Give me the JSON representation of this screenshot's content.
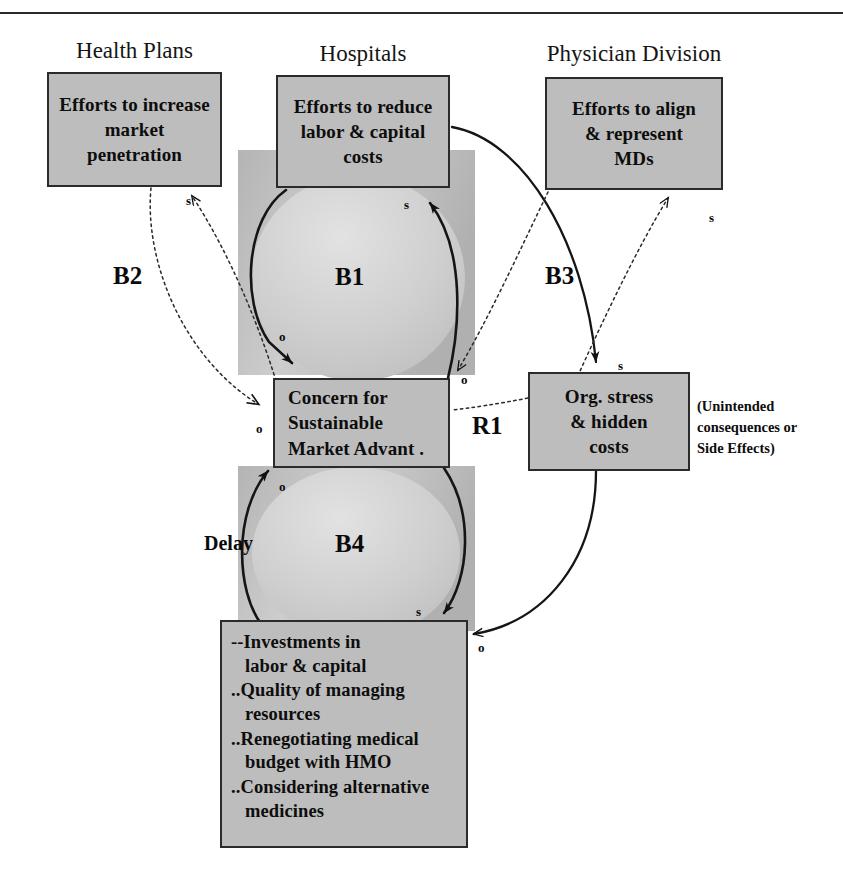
{
  "page": {
    "clipped_header_text": "",
    "background": "#ffffff",
    "box_fill": "#bdbdbd",
    "box_stroke": "#2b2b2b",
    "band_fill": "#bdbdbd",
    "line_color": "#1a1a1a"
  },
  "captions": [
    {
      "id": "health-plans",
      "label": "Health Plans"
    },
    {
      "id": "hospitals",
      "label": "Hospitals"
    },
    {
      "id": "physician-division",
      "label": "Physician Division"
    }
  ],
  "nodes": {
    "health_plans": {
      "lines": [
        "Efforts to increase",
        "market",
        "penetration"
      ]
    },
    "hospitals": {
      "lines": [
        "Efforts to reduce",
        "labor & capital",
        "costs"
      ]
    },
    "physician": {
      "lines": [
        "Efforts to align",
        "& represent",
        "MDs"
      ]
    },
    "concern": {
      "lines": [
        "Concern for",
        "Sustainable",
        "Market  Advant ."
      ]
    },
    "org_stress": {
      "lines": [
        "Org. stress",
        "& hidden",
        "costs"
      ]
    },
    "investments": {
      "items": [
        {
          "bullet": "--",
          "l1": "Investments in",
          "l2": "labor & capital"
        },
        {
          "bullet": "..",
          "l1": "Quality of managing",
          "l2": "resources"
        },
        {
          "bullet": "..",
          "l1": "Renegotiating medical",
          "l2": "budget with HMO"
        },
        {
          "bullet": "..",
          "l1": "Considering alternative",
          "l2": "medicines"
        }
      ]
    }
  },
  "loops": [
    {
      "id": "B2",
      "label": "B2"
    },
    {
      "id": "B1",
      "label": "B1"
    },
    {
      "id": "B3",
      "label": "B3"
    },
    {
      "id": "R1",
      "label": "R1"
    },
    {
      "id": "B4",
      "label": "B4"
    }
  ],
  "delay": {
    "label": "Delay"
  },
  "side_note": {
    "lines": [
      "(Unintended",
      "consequences or",
      "Side Effects)"
    ]
  },
  "polarities": [
    {
      "id": "p-hp-s",
      "mark": "s",
      "x": 186,
      "y": 193
    },
    {
      "id": "p-hosp-s",
      "mark": "s",
      "x": 404,
      "y": 197
    },
    {
      "id": "p-phys-s",
      "mark": "s",
      "x": 709,
      "y": 210
    },
    {
      "id": "p-b1-o",
      "mark": "o",
      "x": 279,
      "y": 329
    },
    {
      "id": "p-b3-o",
      "mark": "o",
      "x": 461,
      "y": 372
    },
    {
      "id": "p-b3-s",
      "mark": "s",
      "x": 618,
      "y": 358
    },
    {
      "id": "p-concern-o",
      "mark": "o",
      "x": 256,
      "y": 421
    },
    {
      "id": "p-b4-o",
      "mark": "o",
      "x": 279,
      "y": 479
    },
    {
      "id": "p-b4-s",
      "mark": "s",
      "x": 416,
      "y": 604
    },
    {
      "id": "p-inv-o",
      "mark": "o",
      "x": 478,
      "y": 640
    }
  ]
}
